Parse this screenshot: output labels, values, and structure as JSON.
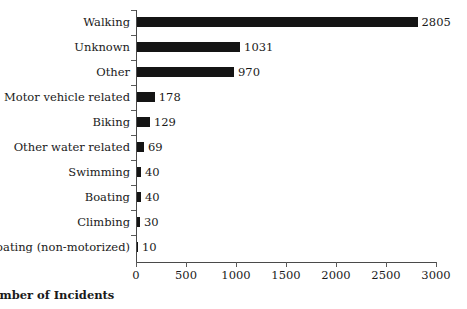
{
  "chart_data": {
    "type": "bar",
    "orientation": "horizontal",
    "title": "",
    "xlabel": "Number of Incidents",
    "ylabel": "",
    "xlim": [
      0,
      3000
    ],
    "xticks": [
      0,
      500,
      1000,
      1500,
      2000,
      2500,
      3000
    ],
    "xtick_labels": [
      "0",
      "500",
      "1000",
      "1500",
      "2000",
      "2500",
      "3000"
    ],
    "grid": false,
    "legend": null,
    "bar_color": "#141414",
    "axis_color": "#4a4a4a",
    "categories": [
      "Walking",
      "Unknown",
      "Other",
      "Motor vehicle related",
      "Biking",
      "Other water related",
      "Swimming",
      "Boating",
      "Climbing",
      "Boating (non-motorized)"
    ],
    "values": [
      2805,
      1031,
      970,
      178,
      129,
      69,
      40,
      40,
      30,
      10
    ],
    "data_labels": [
      "2805",
      "1031",
      "970",
      "178",
      "129",
      "69",
      "40",
      "40",
      "30",
      "10"
    ]
  }
}
